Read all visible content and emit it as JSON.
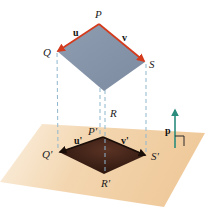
{
  "diagram": {
    "colors": {
      "upper_parallelogram": "#8796a8",
      "lower_parallelogram": "#3a2016",
      "plane": "#efc99a",
      "plane_fade": "#fbf1e2",
      "vector_arrows_upper": "#d43a1c",
      "vector_arrows_lower": "#1a0e08",
      "projection_lines": "#8fb7cf",
      "normal_vector": "#2a8c7c",
      "right_angle_mark": "#2a2a2a"
    },
    "upper": {
      "vertices": [
        "P",
        "Q",
        "R",
        "S"
      ],
      "labels": {
        "P": "P",
        "Q": "Q",
        "R": "R",
        "S": "S"
      },
      "vector_labels": {
        "u": "u",
        "v": "v"
      }
    },
    "lower": {
      "vertices": [
        "P'",
        "Q'",
        "R'",
        "S'"
      ],
      "labels": {
        "P": "P'",
        "Q": "Q'",
        "R": "R'",
        "S": "S'"
      },
      "vector_labels": {
        "u": "u'",
        "v": "v'"
      }
    },
    "normal": {
      "label": "p"
    }
  }
}
